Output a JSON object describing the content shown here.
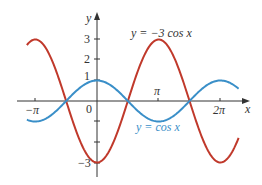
{
  "chart_data": {
    "type": "line",
    "title": "",
    "xlabel": "x",
    "ylabel": "y",
    "x_tick_labels": [
      "−π",
      "0",
      "π",
      "2π"
    ],
    "y_tick_labels": [
      "1",
      "2",
      "3",
      "−3"
    ],
    "xlim": [
      -3.5,
      7.1
    ],
    "ylim": [
      -3.5,
      3.5
    ],
    "grid": false,
    "series": [
      {
        "name": "y = −3 cos x",
        "color": "#c0392b",
        "function": "-3*cos(x)",
        "x_range": [
          -3.57,
          7.21
        ],
        "points": [
          [
            -3.1416,
            3
          ],
          [
            -1.5708,
            0
          ],
          [
            0,
            -3
          ],
          [
            1.5708,
            0
          ],
          [
            3.1416,
            3
          ],
          [
            4.7124,
            0
          ],
          [
            6.2832,
            -3
          ]
        ]
      },
      {
        "name": "y = cos x",
        "color": "#3a8fc8",
        "function": "cos(x)",
        "x_range": [
          -3.57,
          7.21
        ],
        "points": [
          [
            -3.1416,
            -1
          ],
          [
            -1.5708,
            0
          ],
          [
            0,
            1
          ],
          [
            1.5708,
            0
          ],
          [
            3.1416,
            -1
          ],
          [
            4.7124,
            0
          ],
          [
            6.2832,
            1
          ]
        ]
      }
    ],
    "annotations": [
      {
        "text": "y = −3 cos x",
        "color": "#222222"
      },
      {
        "text": "y = cos x",
        "color": "#3a8fc8"
      }
    ]
  },
  "labels": {
    "y_axis": "y",
    "x_axis": "x",
    "tick_neg_pi": "−π",
    "tick_zero": "0",
    "tick_pi": "π",
    "tick_2pi": "2π",
    "tick_1": "1",
    "tick_2": "2",
    "tick_3": "3",
    "tick_neg3": "−3",
    "red_label": "y = −3 cos x",
    "blue_label": "y = cos x"
  }
}
